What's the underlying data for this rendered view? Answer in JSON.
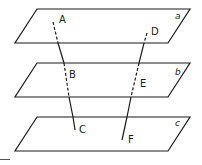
{
  "diagram": {
    "stroke_color": "#1a1a1a",
    "planes": [
      {
        "label": "a",
        "points": "37,9 190,9 168,43 15,43",
        "label_x": 175,
        "label_y": 19
      },
      {
        "label": "b",
        "points": "37,63 190,63 168,97 15,97",
        "label_x": 175,
        "label_y": 75
      },
      {
        "label": "c",
        "points": "37,117 190,117 168,151 15,151",
        "label_x": 175,
        "label_y": 126
      }
    ],
    "lines": [
      {
        "name": "ABC",
        "segments": [
          {
            "x1": 53,
            "y1": 22,
            "x2": 58,
            "y2": 43,
            "style": "dashed"
          },
          {
            "x1": 58,
            "y1": 43,
            "x2": 64,
            "y2": 63,
            "style": "solid"
          },
          {
            "x1": 64,
            "y1": 63,
            "x2": 69,
            "y2": 97,
            "style": "dashed"
          },
          {
            "x1": 69,
            "y1": 97,
            "x2": 73,
            "y2": 117,
            "style": "solid"
          },
          {
            "x1": 73,
            "y1": 117,
            "x2": 75,
            "y2": 130,
            "style": "solid"
          }
        ],
        "points": [
          {
            "label": "A",
            "x": 59,
            "y": 23
          },
          {
            "label": "B",
            "x": 69,
            "y": 78
          },
          {
            "label": "C",
            "x": 79,
            "y": 133
          }
        ]
      },
      {
        "name": "DEF",
        "segments": [
          {
            "x1": 147,
            "y1": 33,
            "x2": 144,
            "y2": 43,
            "style": "dashed"
          },
          {
            "x1": 144,
            "y1": 43,
            "x2": 139,
            "y2": 63,
            "style": "solid"
          },
          {
            "x1": 139,
            "y1": 63,
            "x2": 131,
            "y2": 97,
            "style": "dashed"
          },
          {
            "x1": 131,
            "y1": 97,
            "x2": 127,
            "y2": 117,
            "style": "solid"
          },
          {
            "x1": 127,
            "y1": 117,
            "x2": 122,
            "y2": 140,
            "style": "solid"
          }
        ],
        "points": [
          {
            "label": "D",
            "x": 151,
            "y": 35
          },
          {
            "label": "E",
            "x": 140,
            "y": 87
          },
          {
            "label": "F",
            "x": 128,
            "y": 143
          }
        ]
      }
    ]
  }
}
